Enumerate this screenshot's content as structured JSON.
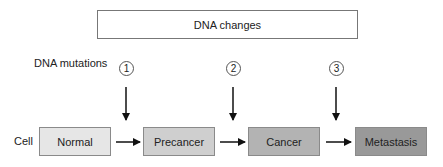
{
  "title_box": {
    "label": "DNA changes"
  },
  "row_labels": {
    "mutations": "DNA mutations",
    "cell": "Cell"
  },
  "mutations": [
    {
      "number": "1"
    },
    {
      "number": "2"
    },
    {
      "number": "3"
    }
  ],
  "stages": [
    {
      "label": "Normal",
      "fill": "#e6e6e6"
    },
    {
      "label": "Precancer",
      "fill": "#cfcfcf"
    },
    {
      "label": "Cancer",
      "fill": "#b3b3b3"
    },
    {
      "label": "Metastasis",
      "fill": "#999999"
    }
  ],
  "colors": {
    "arrow": "#111111",
    "border": "#8a8a8a"
  }
}
